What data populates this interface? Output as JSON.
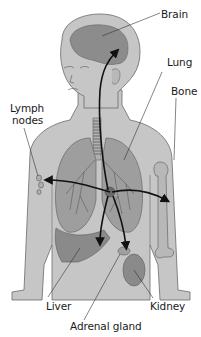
{
  "diagram": {
    "type": "anatomical-illustration",
    "labels": {
      "brain": "Brain",
      "lung": "Lung",
      "bone": "Bone",
      "lymph_nodes_line1": "Lymph",
      "lymph_nodes_line2": "nodes",
      "liver": "Liver",
      "kidney": "Kidney",
      "adrenal_gland": "Adrenal gland"
    },
    "colors": {
      "skin": "#c4c4c4",
      "organ_dark": "#8a8a8a",
      "organ_mid": "#a8a8a8",
      "outline": "#555555",
      "arrow": "#111111",
      "bone": "#bcbcbc"
    }
  }
}
